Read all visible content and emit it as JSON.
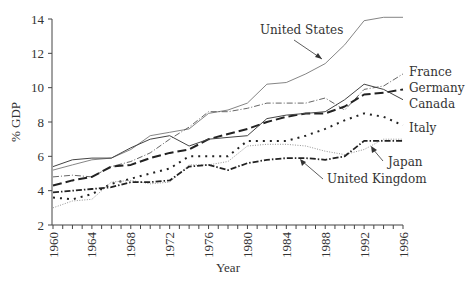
{
  "chart_data": {
    "type": "line",
    "title": "",
    "xlabel": "Year",
    "ylabel": "% GDP",
    "xlim": [
      1960,
      1996
    ],
    "ylim": [
      2,
      14
    ],
    "x_ticks": [
      1960,
      1964,
      1968,
      1972,
      1976,
      1980,
      1984,
      1988,
      1992,
      1996
    ],
    "y_ticks": [
      2,
      4,
      6,
      8,
      10,
      12,
      14
    ],
    "grid": false,
    "legend_position": "inline labels",
    "x": [
      1960,
      1962,
      1964,
      1966,
      1968,
      1970,
      1972,
      1974,
      1976,
      1978,
      1980,
      1982,
      1984,
      1986,
      1988,
      1990,
      1992,
      1994,
      1996
    ],
    "series": [
      {
        "name": "United States",
        "values": [
          5.2,
          5.5,
          5.8,
          5.9,
          6.4,
          7.2,
          7.4,
          7.6,
          8.5,
          8.7,
          9.1,
          10.2,
          10.3,
          10.8,
          11.4,
          12.5,
          13.9,
          14.1,
          14.1
        ]
      },
      {
        "name": "France",
        "values": [
          4.8,
          4.9,
          4.8,
          5.4,
          5.7,
          6.2,
          7.0,
          7.7,
          8.6,
          8.6,
          8.8,
          9.1,
          9.1,
          9.1,
          9.4,
          8.7,
          9.9,
          10.1,
          10.8
        ]
      },
      {
        "name": "Germany",
        "values": [
          4.3,
          4.6,
          4.8,
          5.4,
          5.5,
          5.9,
          6.2,
          6.4,
          7.0,
          7.3,
          7.6,
          8.0,
          8.3,
          8.5,
          8.5,
          8.9,
          9.6,
          9.7,
          9.9
        ]
      },
      {
        "name": "Canada",
        "values": [
          5.4,
          5.8,
          5.9,
          5.9,
          6.5,
          7.0,
          7.2,
          6.6,
          7.0,
          7.1,
          7.2,
          8.2,
          8.4,
          8.5,
          8.6,
          9.3,
          10.2,
          9.9,
          9.3
        ]
      },
      {
        "name": "Italy",
        "values": [
          3.6,
          3.5,
          3.8,
          4.4,
          4.7,
          5.0,
          5.3,
          6.0,
          6.0,
          6.0,
          6.9,
          6.9,
          6.9,
          7.2,
          7.6,
          8.1,
          8.5,
          8.3,
          7.8
        ]
      },
      {
        "name": "Japan",
        "values": [
          3.0,
          3.4,
          3.5,
          4.5,
          4.6,
          4.4,
          4.5,
          5.5,
          5.5,
          5.7,
          6.6,
          6.7,
          6.7,
          6.6,
          6.3,
          6.1,
          6.4,
          7.0,
          7.0
        ]
      },
      {
        "name": "United Kingdom",
        "values": [
          3.9,
          4.0,
          4.1,
          4.2,
          4.5,
          4.5,
          4.6,
          5.4,
          5.5,
          5.2,
          5.6,
          5.8,
          5.9,
          5.9,
          5.8,
          6.0,
          6.9,
          6.9,
          6.9
        ]
      }
    ],
    "annotations": [
      {
        "text": "United States",
        "arrow_to_year": 1986
      },
      {
        "text": "Japan",
        "arrow_to_year": 1992
      },
      {
        "text": "United Kingdom",
        "arrow_to_year": 1984
      }
    ]
  },
  "labels": {
    "ylabel": "% GDP",
    "xlabel": "Year",
    "us": "United States",
    "france": "France",
    "germany": "Germany",
    "canada": "Canada",
    "italy": "Italy",
    "japan": "Japan",
    "uk": "United Kingdom"
  }
}
